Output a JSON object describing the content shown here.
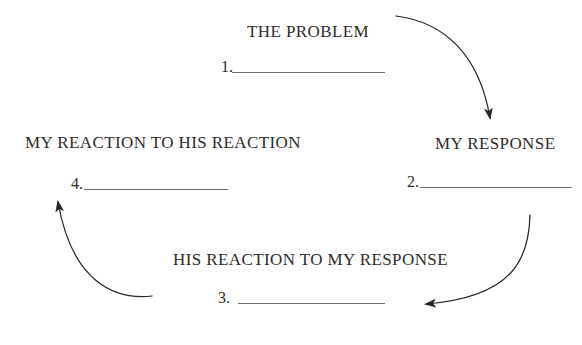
{
  "diagram": {
    "nodes": [
      {
        "id": "problem",
        "title": "THE PROBLEM",
        "number": "1."
      },
      {
        "id": "my-response",
        "title": "MY RESPONSE",
        "number": "2."
      },
      {
        "id": "his-reaction",
        "title": "HIS REACTION TO MY RESPONSE",
        "number": "3."
      },
      {
        "id": "my-reaction",
        "title": "MY REACTION TO HIS REACTION",
        "number": "4."
      }
    ],
    "arrows": [
      {
        "name": "problem-to-my-response",
        "from": "THE PROBLEM",
        "to": "MY RESPONSE"
      },
      {
        "name": "my-response-to-his-reaction",
        "from": "MY RESPONSE",
        "to": "HIS REACTION TO MY RESPONSE"
      },
      {
        "name": "his-reaction-to-my-reaction",
        "from": "HIS REACTION TO MY RESPONSE",
        "to": "MY REACTION TO HIS REACTION"
      }
    ],
    "colors": {
      "text": "#2e2b29",
      "underline": "#6e6e6e",
      "arrow": "#262626",
      "background": "#ffffff"
    }
  }
}
